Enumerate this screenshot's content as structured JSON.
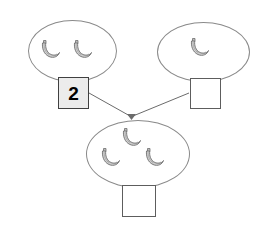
{
  "worksheet": {
    "title": "Banana addition number bond",
    "background_color": "#ffffff",
    "line_color": "#8a8a8a",
    "box_border_color": "#5d5d5d",
    "filled_box_color": "#ececec",
    "banana_fill": "#cfcfcf",
    "banana_outline": "#6f6f6f"
  },
  "groups": {
    "left": {
      "name": "first-addend-group",
      "banana_count": 2,
      "bananas": [
        {
          "label": "banana",
          "x": 36,
          "y": 38
        },
        {
          "label": "banana",
          "x": 68,
          "y": 38
        }
      ],
      "box": {
        "value": "2",
        "filled": true,
        "placeholder": ""
      }
    },
    "right": {
      "name": "second-addend-group",
      "banana_count": 1,
      "bananas": [
        {
          "label": "banana",
          "x": 185,
          "y": 36
        }
      ],
      "box": {
        "value": "",
        "filled": false,
        "placeholder": ""
      }
    },
    "sum": {
      "name": "sum-group",
      "banana_count": 3,
      "bananas": [
        {
          "label": "banana",
          "x": 117,
          "y": 126
        },
        {
          "label": "banana",
          "x": 96,
          "y": 146
        },
        {
          "label": "banana",
          "x": 140,
          "y": 146
        }
      ],
      "box": {
        "value": "",
        "filled": false,
        "placeholder": ""
      }
    }
  },
  "connectors": [
    {
      "name": "left-to-sum",
      "from": "first-addend-box",
      "to": "sum-junction"
    },
    {
      "name": "right-to-sum",
      "from": "second-addend-box",
      "to": "sum-junction"
    }
  ]
}
